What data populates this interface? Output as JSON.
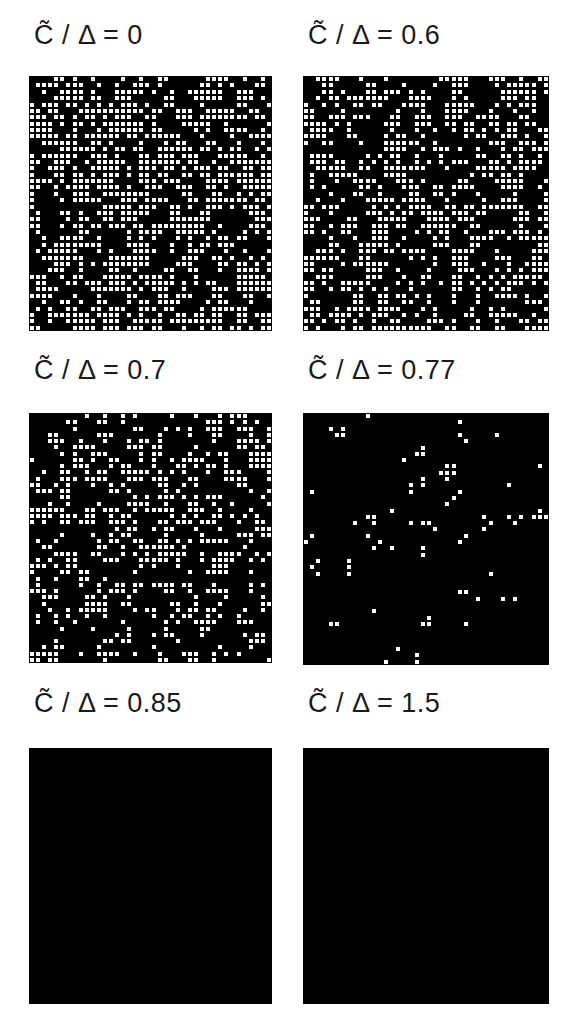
{
  "figure": {
    "grid_size": 40,
    "cell_color": "#ffffff",
    "background_color": "#000000",
    "symbol": "C",
    "separator": "/",
    "param": "Δ",
    "equals": "=",
    "panels": [
      {
        "id": "p1",
        "value": "0",
        "density": 0.5,
        "seed": 11,
        "x": 29,
        "y": 76,
        "w": 243,
        "h": 255,
        "label_x": 34,
        "label_y": 20
      },
      {
        "id": "p2",
        "value": "0.6",
        "density": 0.46,
        "seed": 23,
        "x": 303,
        "y": 76,
        "w": 246,
        "h": 255,
        "label_x": 308,
        "label_y": 20
      },
      {
        "id": "p3",
        "value": "0.7",
        "density": 0.42,
        "seed": 37,
        "x": 29,
        "y": 413,
        "w": 243,
        "h": 250,
        "label_x": 34,
        "label_y": 355
      },
      {
        "id": "p4",
        "value": "0.77",
        "density": 0.26,
        "seed": 51,
        "x": 303,
        "y": 413,
        "w": 246,
        "h": 252,
        "label_x": 308,
        "label_y": 355
      },
      {
        "id": "p5",
        "value": "0.85",
        "density": 0.08,
        "seed": 67,
        "x": 29,
        "y": 748,
        "w": 243,
        "h": 256,
        "label_x": 34,
        "label_y": 688
      },
      {
        "id": "p6",
        "value": "1.5",
        "density": 0.0,
        "seed": 79,
        "x": 303,
        "y": 748,
        "w": 246,
        "h": 256,
        "label_x": 308,
        "label_y": 688
      }
    ]
  },
  "labels": {
    "p1": "C̃ / Δ = 0",
    "p2": "C̃ / Δ = 0.6",
    "p3": "C̃ / Δ = 0.7",
    "p4": "C̃ / Δ = 0.77",
    "p5": "C̃ / Δ = 0.85",
    "p6": "C̃ / Δ = 1.5"
  }
}
